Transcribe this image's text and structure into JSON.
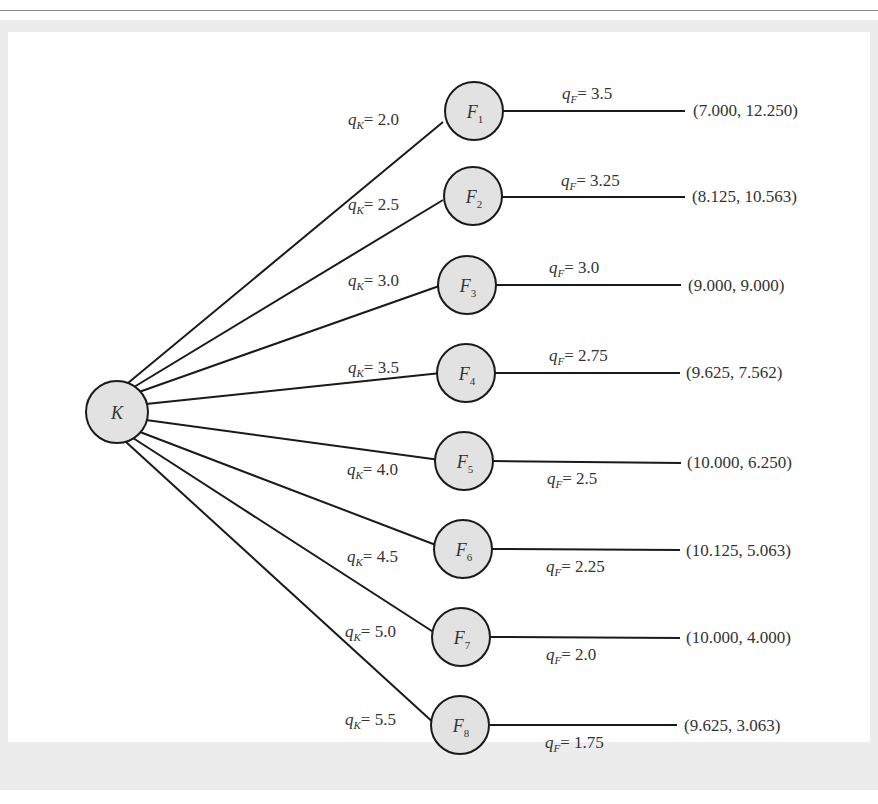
{
  "diagram": {
    "type": "game-tree",
    "root": {
      "id": "K",
      "label": "K"
    },
    "qK_symbol": "q",
    "qK_sub": "K",
    "qF_symbol": "q",
    "qF_sub": "F",
    "equals": "= ",
    "branches": [
      {
        "node": "F",
        "node_sub": "1",
        "qK": "2.0",
        "qF": "3.5",
        "payoff": "(7.000, 12.250)"
      },
      {
        "node": "F",
        "node_sub": "2",
        "qK": "2.5",
        "qF": "3.25",
        "payoff": "(8.125, 10.563)"
      },
      {
        "node": "F",
        "node_sub": "3",
        "qK": "3.0",
        "qF": "3.0",
        "payoff": "(9.000, 9.000)"
      },
      {
        "node": "F",
        "node_sub": "4",
        "qK": "3.5",
        "qF": "2.75",
        "payoff": "(9.625, 7.562)"
      },
      {
        "node": "F",
        "node_sub": "5",
        "qK": "4.0",
        "qF": "2.5",
        "payoff": "(10.000, 6.250)"
      },
      {
        "node": "F",
        "node_sub": "6",
        "qK": "4.5",
        "qF": "2.25",
        "payoff": "(10.125, 5.063)"
      },
      {
        "node": "F",
        "node_sub": "7",
        "qK": "5.0",
        "qF": "2.0",
        "payoff": "(10.000, 4.000)"
      },
      {
        "node": "F",
        "node_sub": "8",
        "qK": "5.5",
        "qF": "1.75",
        "payoff": "(9.625, 3.063)"
      }
    ]
  }
}
